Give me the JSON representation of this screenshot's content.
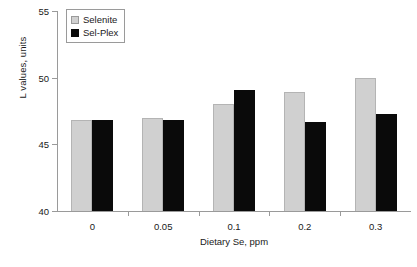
{
  "chart_data": {
    "type": "bar",
    "title": "",
    "xlabel": "Dietary Se, ppm",
    "ylabel": "L values, units",
    "categories": [
      "0",
      "0.05",
      "0.1",
      "0.2",
      "0.3"
    ],
    "series": [
      {
        "name": "Selenite",
        "color": "#d0d0d0",
        "values": [
          46.85,
          47.0,
          48.0,
          48.9,
          50.0
        ]
      },
      {
        "name": "Sel-Plex",
        "color": "#0a0a0a",
        "values": [
          46.85,
          46.85,
          49.1,
          46.7,
          47.3
        ]
      }
    ],
    "ylim": [
      40,
      55
    ],
    "yticks": [
      "40",
      "45",
      "50",
      "55"
    ],
    "ytick_values": [
      40,
      45,
      50,
      55
    ],
    "grid": false,
    "legend_position": "top-left-inside"
  }
}
